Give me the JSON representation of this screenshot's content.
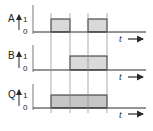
{
  "diagram": {
    "type": "timing-diagram",
    "time_label": "t",
    "guide_lines_x": [
      51,
      70,
      88,
      107
    ],
    "colors": {
      "line": "#2a2a2a",
      "guide": "#8a8a8a",
      "pulse_fill": "#d9d9d9",
      "output_fill": "#c6c6c6"
    },
    "signals": [
      {
        "name": "A",
        "high": "1",
        "low": "0",
        "pulses": [
          [
            51,
            70
          ],
          [
            88,
            107
          ]
        ]
      },
      {
        "name": "B",
        "high": "1",
        "low": "0",
        "pulses": [
          [
            70,
            107
          ]
        ]
      },
      {
        "name": "Q",
        "high": "1",
        "low": "0",
        "pulses": [
          [
            51,
            107
          ]
        ]
      }
    ]
  }
}
